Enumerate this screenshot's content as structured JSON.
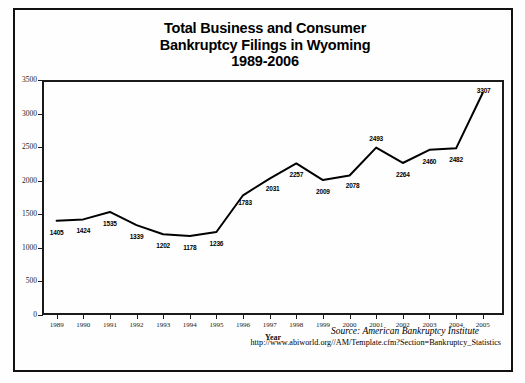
{
  "title": {
    "line1": "Total Business and Consumer",
    "line2": "Bankruptcy Filings in Wyoming",
    "line3": "1989-2006"
  },
  "source": {
    "attribution": "Source: American Bankruptcy Institute",
    "url": "http://www.abiworld.org//AM/Template.cfm?Section=Bankruptcy_Statistics"
  },
  "chart_data": {
    "type": "line",
    "title": "Total Business and Consumer Bankruptcy Filings in Wyoming 1989-2006",
    "xlabel": "Year",
    "ylabel": "",
    "ylim": [
      0,
      3500
    ],
    "yticks": [
      0,
      500,
      1000,
      1500,
      2000,
      2500,
      3000,
      3500
    ],
    "grid": false,
    "legend": "none",
    "categories": [
      "1989",
      "1990",
      "1991",
      "1992",
      "1993",
      "1994",
      "1995",
      "1996",
      "1997",
      "1998",
      "1999",
      "2000",
      "2001",
      "2002",
      "2003",
      "2004",
      "2005"
    ],
    "values": [
      1405,
      1424,
      1535,
      1339,
      1202,
      1178,
      1236,
      1783,
      2031,
      2257,
      2009,
      2078,
      2493,
      2264,
      2460,
      2482,
      3307
    ],
    "point_labels": [
      "1405",
      "1424",
      "1535",
      "1339",
      "1202",
      "1178",
      "1236",
      "1783",
      "2031",
      "2257",
      "2009",
      "2078",
      "2493",
      "2264",
      "2460",
      "2482",
      "3307"
    ],
    "line_color": "#000000",
    "line_width": 2
  }
}
